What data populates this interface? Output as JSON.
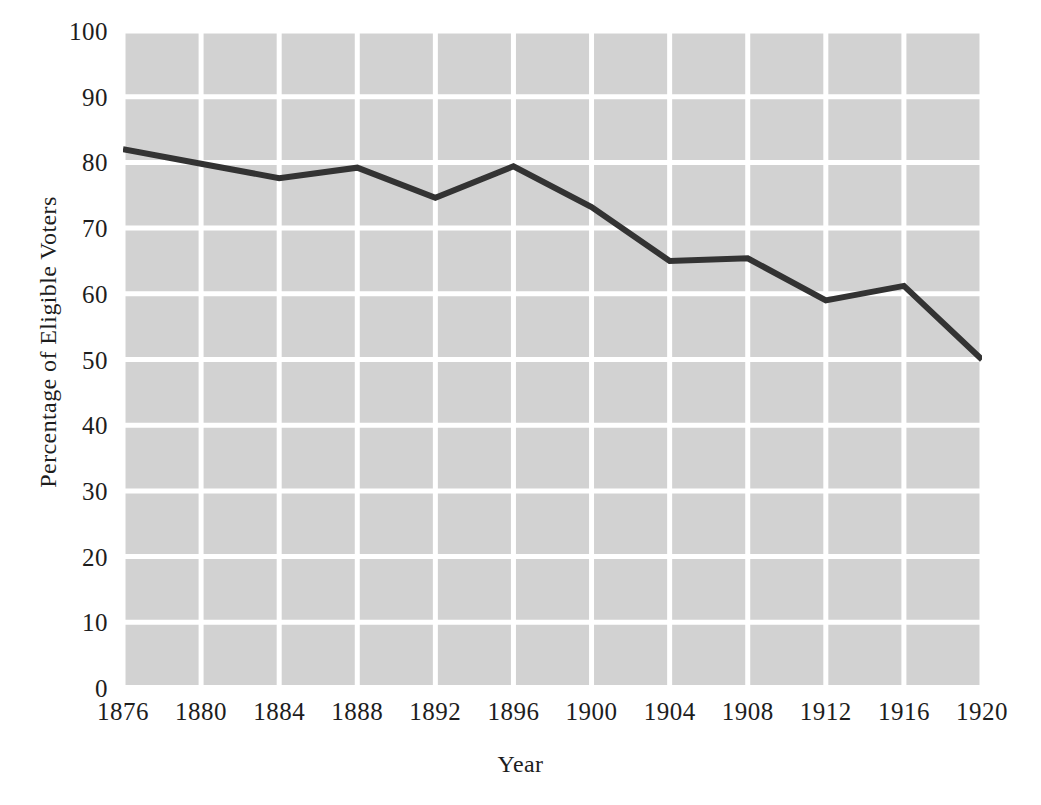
{
  "chart_data": {
    "type": "line",
    "title": "",
    "xlabel": "Year",
    "ylabel": "Percentage of Eligible Voters",
    "x": [
      1876,
      1880,
      1884,
      1888,
      1892,
      1896,
      1900,
      1904,
      1908,
      1912,
      1916,
      1920
    ],
    "values": [
      82,
      79.8,
      77.6,
      79.2,
      74.6,
      79.4,
      73.2,
      65,
      65.4,
      59,
      61.2,
      50
    ],
    "series": [
      {
        "name": "Percentage of Eligible Voters",
        "values": [
          82,
          79.8,
          77.6,
          79.2,
          74.6,
          79.4,
          73.2,
          65,
          65.4,
          59,
          61.2,
          50
        ]
      }
    ],
    "x_tick_labels": [
      "1876",
      "1880",
      "1884",
      "1888",
      "1892",
      "1896",
      "1900",
      "1904",
      "1908",
      "1912",
      "1916",
      "1920"
    ],
    "y_tick_labels": [
      "0",
      "10",
      "20",
      "30",
      "40",
      "50",
      "60",
      "70",
      "80",
      "90",
      "100"
    ],
    "y_ticks": [
      0,
      10,
      20,
      30,
      40,
      50,
      60,
      70,
      80,
      90,
      100
    ],
    "xlim": [
      1876,
      1920
    ],
    "ylim": [
      0,
      100
    ],
    "grid": true,
    "legend": "none",
    "colors": {
      "plot_background": "#d2d2d2",
      "gridline": "#ffffff",
      "line": "#333333",
      "text": "#1d1d1d",
      "page_background": "#ffffff"
    },
    "line_width": 6
  }
}
